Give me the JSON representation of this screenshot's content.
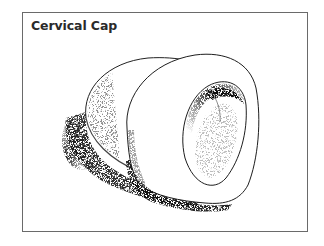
{
  "figure": {
    "title": "Cervical Cap",
    "style": "stippled line drawing",
    "colors": {
      "border": "#6a6a6a",
      "ink": "#1e1e1e",
      "background": "#ffffff"
    }
  }
}
